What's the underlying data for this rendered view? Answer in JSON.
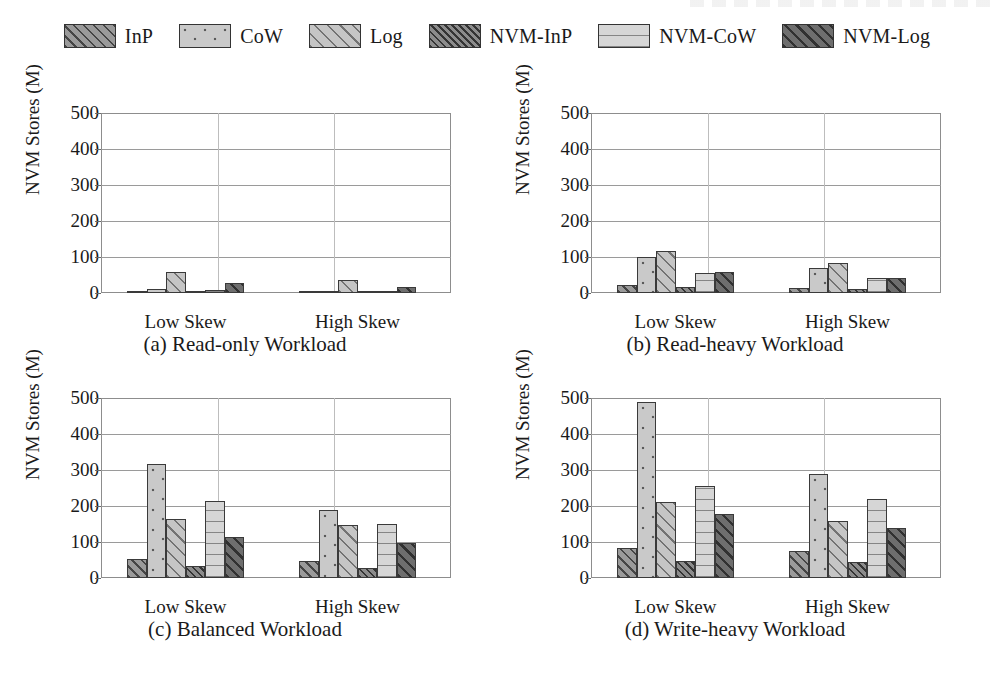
{
  "figure": {
    "ylabel": "NVM Stores (M)",
    "ytick_labels": [
      "0",
      "100",
      "200",
      "300",
      "400",
      "500"
    ],
    "group_labels": [
      "Low Skew",
      "High Skew"
    ]
  },
  "legend": {
    "position": "top-center",
    "entries": [
      {
        "label": "InP",
        "pattern": "diagonal-hatch-dark",
        "color": "#9a9a9a",
        "swatch_class": "p-inp"
      },
      {
        "label": "CoW",
        "pattern": "dotted",
        "color": "#c9c9c9",
        "swatch_class": "p-cow"
      },
      {
        "label": "Log",
        "pattern": "diagonal-hatch-light",
        "color": "#c5c5c5",
        "swatch_class": "p-log"
      },
      {
        "label": "NVM-InP",
        "pattern": "dense-diagonal-hatch",
        "color": "#8c8c8c",
        "swatch_class": "p-nvminp"
      },
      {
        "label": "NVM-CoW",
        "pattern": "horizontal-lines",
        "color": "#d6d6d6",
        "swatch_class": "p-nvmcow"
      },
      {
        "label": "NVM-Log",
        "pattern": "diagonal-hatch-darkest",
        "color": "#6e6e6e",
        "swatch_class": "p-nvmlog"
      }
    ]
  },
  "chart_data": [
    {
      "id": "a",
      "type": "bar",
      "title": "(a) Read-only Workload",
      "xlabel": "",
      "ylabel": "NVM Stores (M)",
      "categories": [
        "Low Skew",
        "High Skew"
      ],
      "ylim": [
        0,
        500
      ],
      "yticks": [
        0,
        100,
        200,
        300,
        400,
        500
      ],
      "grid": true,
      "legend": "shared-top",
      "series": [
        {
          "name": "InP",
          "values": [
            5,
            2
          ]
        },
        {
          "name": "CoW",
          "values": [
            11,
            3
          ]
        },
        {
          "name": "Log",
          "values": [
            58,
            36
          ]
        },
        {
          "name": "NVM-InP",
          "values": [
            3,
            2
          ]
        },
        {
          "name": "NVM-CoW",
          "values": [
            9,
            2
          ]
        },
        {
          "name": "NVM-Log",
          "values": [
            28,
            17
          ]
        }
      ]
    },
    {
      "id": "b",
      "type": "bar",
      "title": "(b) Read-heavy Workload",
      "xlabel": "",
      "ylabel": "NVM Stores (M)",
      "categories": [
        "Low Skew",
        "High Skew"
      ],
      "ylim": [
        0,
        500
      ],
      "yticks": [
        0,
        100,
        200,
        300,
        400,
        500
      ],
      "grid": true,
      "legend": "shared-top",
      "series": [
        {
          "name": "InP",
          "values": [
            22,
            14
          ]
        },
        {
          "name": "CoW",
          "values": [
            100,
            70
          ]
        },
        {
          "name": "Log",
          "values": [
            118,
            84
          ]
        },
        {
          "name": "NVM-InP",
          "values": [
            17,
            10
          ]
        },
        {
          "name": "NVM-CoW",
          "values": [
            55,
            41
          ]
        },
        {
          "name": "NVM-Log",
          "values": [
            58,
            43
          ]
        }
      ]
    },
    {
      "id": "c",
      "type": "bar",
      "title": "(c) Balanced Workload",
      "xlabel": "",
      "ylabel": "NVM Stores (M)",
      "categories": [
        "Low Skew",
        "High Skew"
      ],
      "ylim": [
        0,
        500
      ],
      "yticks": [
        0,
        100,
        200,
        300,
        400,
        500
      ],
      "grid": true,
      "legend": "shared-top",
      "series": [
        {
          "name": "InP",
          "values": [
            52,
            46
          ]
        },
        {
          "name": "CoW",
          "values": [
            317,
            188
          ]
        },
        {
          "name": "Log",
          "values": [
            165,
            147
          ]
        },
        {
          "name": "NVM-InP",
          "values": [
            33,
            27
          ]
        },
        {
          "name": "NVM-CoW",
          "values": [
            214,
            150
          ]
        },
        {
          "name": "NVM-Log",
          "values": [
            114,
            96
          ]
        }
      ]
    },
    {
      "id": "d",
      "type": "bar",
      "title": "(d) Write-heavy Workload",
      "xlabel": "",
      "ylabel": "NVM Stores (M)",
      "categories": [
        "Low Skew",
        "High Skew"
      ],
      "ylim": [
        0,
        500
      ],
      "yticks": [
        0,
        100,
        200,
        300,
        400,
        500
      ],
      "grid": true,
      "legend": "shared-top",
      "series": [
        {
          "name": "InP",
          "values": [
            82,
            74
          ]
        },
        {
          "name": "CoW",
          "values": [
            488,
            289
          ]
        },
        {
          "name": "Log",
          "values": [
            212,
            159
          ]
        },
        {
          "name": "NVM-InP",
          "values": [
            47,
            44
          ]
        },
        {
          "name": "NVM-CoW",
          "values": [
            255,
            219
          ]
        },
        {
          "name": "NVM-Log",
          "values": [
            177,
            140
          ]
        }
      ]
    }
  ]
}
